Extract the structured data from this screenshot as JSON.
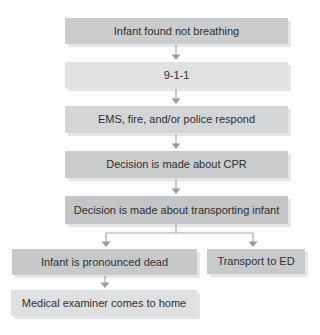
{
  "figure": {
    "type": "flowchart",
    "background": "#fdfdfd"
  },
  "palette": {
    "arrow_line": "#a8aaac",
    "arrow_head": "#9a9c9e",
    "text": "#303030",
    "box_dark": "#c5c7c9",
    "box_light": "#dfe1e2"
  },
  "nodes": [
    {
      "id": "infant-found",
      "label": "Infant found not breathing",
      "fill": "#cacccd"
    },
    {
      "id": "call-911",
      "label": "9-1-1",
      "fill": "#e0e1e3"
    },
    {
      "id": "ems-respond",
      "label": "EMS, fire, and/or police respond",
      "fill": "#d3d5d7"
    },
    {
      "id": "cpr-decision",
      "label": "Decision is made about CPR",
      "fill": "#cacccd"
    },
    {
      "id": "transport-decision",
      "label": "Decision is made about transporting infant",
      "fill": "#c3c5c7"
    },
    {
      "id": "pronounced-dead",
      "label": "Infant is pronounced dead",
      "fill": "#c6c8ca"
    },
    {
      "id": "transport-ed",
      "label": "Transport to ED",
      "fill": "#c7c9cb"
    },
    {
      "id": "medical-examiner",
      "label": "Medical examiner comes to home",
      "fill": "#dfe0e2"
    }
  ],
  "edges": [
    {
      "from": "infant-found",
      "to": "call-911"
    },
    {
      "from": "call-911",
      "to": "ems-respond"
    },
    {
      "from": "ems-respond",
      "to": "cpr-decision"
    },
    {
      "from": "cpr-decision",
      "to": "transport-decision"
    },
    {
      "from": "transport-decision",
      "to": "pronounced-dead"
    },
    {
      "from": "transport-decision",
      "to": "transport-ed"
    },
    {
      "from": "pronounced-dead",
      "to": "medical-examiner"
    }
  ]
}
